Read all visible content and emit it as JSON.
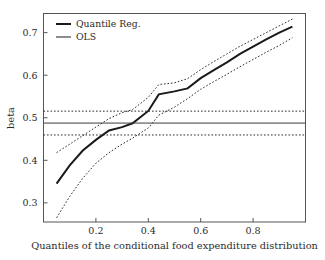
{
  "chart_data": {
    "type": "line",
    "title": "",
    "xlabel": "Quantiles of the conditional food expenditure distribution",
    "ylabel": "beta",
    "xlim": [
      0.0,
      1.0
    ],
    "ylim": [
      0.255,
      0.745
    ],
    "xticks": [
      0.2,
      0.4,
      0.6,
      0.8
    ],
    "xticklabels": [
      "0.2",
      "0.4",
      "0.6",
      "0.8"
    ],
    "yticks": [
      0.3,
      0.4,
      0.5,
      0.6,
      0.7
    ],
    "yticklabels": [
      "0.3",
      "0.4",
      "0.5",
      "0.6",
      "0.7"
    ],
    "grid": false,
    "legend_position": "top-left",
    "legend": [
      {
        "label": "Quantile Reg.",
        "style": "solid-thick"
      },
      {
        "label": "OLS",
        "style": "solid-thin"
      }
    ],
    "x": [
      0.05,
      0.1,
      0.15,
      0.2,
      0.25,
      0.3,
      0.34,
      0.4,
      0.44,
      0.5,
      0.55,
      0.6,
      0.65,
      0.7,
      0.75,
      0.8,
      0.85,
      0.9,
      0.95
    ],
    "series": [
      {
        "name": "Quantile Reg.",
        "style": "solid-thick",
        "values": [
          0.345,
          0.388,
          0.423,
          0.448,
          0.47,
          0.478,
          0.487,
          0.516,
          0.555,
          0.562,
          0.569,
          0.593,
          0.612,
          0.63,
          0.65,
          0.667,
          0.684,
          0.7,
          0.714
        ]
      },
      {
        "name": "Quantile Reg. upper CI",
        "style": "dotted",
        "values": [
          0.418,
          0.438,
          0.458,
          0.478,
          0.498,
          0.512,
          0.519,
          0.548,
          0.578,
          0.582,
          0.592,
          0.613,
          0.632,
          0.65,
          0.668,
          0.684,
          0.7,
          0.716,
          0.732
        ]
      },
      {
        "name": "Quantile Reg. lower CI",
        "style": "dotted",
        "values": [
          0.265,
          0.315,
          0.358,
          0.393,
          0.418,
          0.438,
          0.452,
          0.476,
          0.506,
          0.525,
          0.545,
          0.567,
          0.585,
          0.602,
          0.62,
          0.637,
          0.654,
          0.67,
          0.688
        ]
      },
      {
        "name": "OLS",
        "style": "solid-thin",
        "constant": 0.4875
      },
      {
        "name": "OLS upper CI",
        "style": "dotted",
        "constant": 0.5155
      },
      {
        "name": "OLS lower CI",
        "style": "dotted",
        "constant": 0.4595
      }
    ]
  }
}
